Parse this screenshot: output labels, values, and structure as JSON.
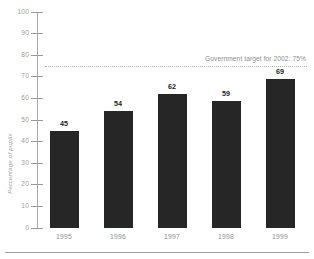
{
  "chart_data": {
    "type": "bar",
    "title": "",
    "xlabel": "",
    "ylabel": "Percentage of pupils",
    "categories": [
      "1995",
      "1996",
      "1997",
      "1998",
      "1999"
    ],
    "values": [
      45,
      54,
      62,
      59,
      69
    ],
    "ylim": [
      0,
      100
    ],
    "yticks": [
      0,
      10,
      20,
      30,
      40,
      50,
      60,
      70,
      80,
      90,
      100
    ],
    "ytick_labels": [
      "0",
      "10",
      "20",
      "30",
      "40",
      "50",
      "60",
      "70",
      "80",
      "90",
      "100"
    ],
    "grid": false,
    "legend": "none",
    "bar_color": "#262626",
    "annotations": [
      {
        "name": "government-target",
        "text": "Government target for 2002: 75%",
        "value": 75,
        "style": "dotted-horizontal-line",
        "color": "#b4b4b4"
      }
    ]
  },
  "axes": {
    "y_title": "Percentage of pupils",
    "tick_color": "#9a9a9a"
  }
}
